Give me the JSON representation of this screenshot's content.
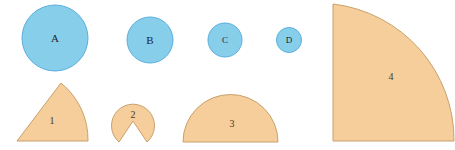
{
  "figure": {
    "background_color": "#ffffff",
    "width": 455,
    "height": 150
  },
  "palette": {
    "circle_fill": "#87CEEB",
    "circle_stroke": "#5aaedd",
    "tan_fill": "#F5CE9C",
    "tan_stroke": "#c8a16a",
    "label_dark": "#20252b",
    "label_brown": "#4a3a20"
  },
  "circles": [
    {
      "label": "A",
      "cx": 55,
      "cy": 38,
      "r": 33,
      "fill": "#87CEEB",
      "stroke": "#5aaedd",
      "font_size": 12
    },
    {
      "label": "B",
      "cx": 150,
      "cy": 40,
      "r": 23,
      "fill": "#87CEEB",
      "stroke": "#5aaedd",
      "font_size": 11
    },
    {
      "label": "C",
      "cx": 225,
      "cy": 40,
      "r": 17,
      "fill": "#87CEEB",
      "stroke": "#5aaedd",
      "font_size": 10
    },
    {
      "label": "D",
      "cx": 289,
      "cy": 40,
      "r": 12.5,
      "fill": "#87CEEB",
      "stroke": "#5aaedd",
      "font_size": 9
    }
  ],
  "sectors": [
    {
      "label": "1",
      "shape": "circular-sector-narrow",
      "path": "M 17 141 L 61 83 A 73 73 0 0 1 88 141 Z",
      "label_x": 52,
      "label_y": 122,
      "fill": "#F5CE9C",
      "stroke": "#c8a16a"
    },
    {
      "label": "2",
      "shape": "disc-with-notch",
      "path": "M 133 121 L 147 142 A 21.5 21.5 0 1 0 119 142 Z",
      "label_x": 133,
      "label_y": 116,
      "fill": "#F5CE9C",
      "stroke": "#c8a16a"
    },
    {
      "label": "3",
      "shape": "semicircle",
      "path": "M 183 142 A 47.5 47.5 0 0 1 278 142 Z",
      "label_x": 232,
      "label_y": 125,
      "fill": "#F5CE9C",
      "stroke": "#c8a16a"
    },
    {
      "label": "4",
      "shape": "quarter-circle",
      "path": "M 333 141 L 333 4 A 137 137 0 0 1 454 141 Z",
      "label_x": 391,
      "label_y": 78,
      "fill": "#F5CE9C",
      "stroke": "#c8a16a"
    }
  ]
}
